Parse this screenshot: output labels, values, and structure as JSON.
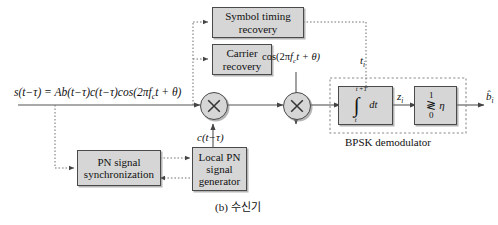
{
  "figure": {
    "caption": "(b) 수신기",
    "group_label": "BPSK demodulator"
  },
  "blocks": {
    "symbol_timing": "Symbol timing\nrecovery",
    "symbol_timing_l1": "Symbol timing",
    "symbol_timing_l2": "recovery",
    "carrier_recovery_l1": "Carrier",
    "carrier_recovery_l2": "recovery",
    "pn_sync_l1": "PN signal",
    "pn_sync_l2": "synchronization",
    "local_pn_l1": "Local PN",
    "local_pn_l2": "signal",
    "local_pn_l3": "generator"
  },
  "signals": {
    "input_equation": "s(t−τ) = Ab(t−τ)c(t−τ)cos(2πf t + θ)",
    "input_lhs": "s(t−τ) = Ab(t−τ)c(t−τ)cos(2π",
    "input_fc": "f",
    "input_fc_sub": "c",
    "input_rhs": "t + θ)",
    "carrier_out": "cos(2πf t + θ)",
    "carrier_out_pre": "cos(2π",
    "carrier_out_f": "f",
    "carrier_out_sub": "c",
    "carrier_out_post": "t + θ)",
    "pn_code": "c(t−τ)",
    "timing_instant": "t",
    "timing_instant_sub": "i",
    "decision_var": "z",
    "decision_var_sub": "i",
    "output_bit": "b̂",
    "output_bit_sub": "i"
  },
  "integrator": {
    "upper_limit": "t +T",
    "upper_limit_sub1": "i",
    "upper_limit_sub2": "b",
    "lower_limit": "t",
    "lower_limit_sub": "i",
    "integral_symbol": "∫",
    "differential": "dt"
  },
  "comparator": {
    "top_value": "1",
    "bottom_value": "0",
    "relation": "≷",
    "threshold": "η"
  },
  "icons": {
    "multiplier_1": "multiply-icon",
    "multiplier_2": "multiply-icon"
  },
  "colors": {
    "block_fill": "#d6d6d6",
    "block_stroke": "#4a4a4a",
    "line": "#555555",
    "background": "#ffffff"
  }
}
